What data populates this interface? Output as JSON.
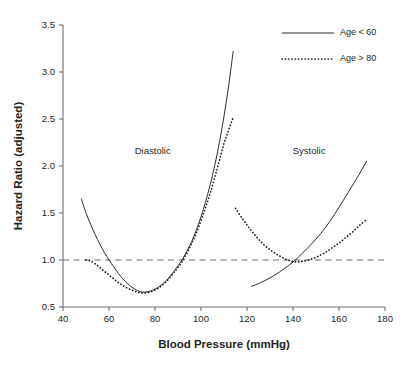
{
  "chart_data": {
    "type": "line",
    "title": "",
    "xlabel": "Blood Pressure (mmHg)",
    "ylabel": "Hazard Ratio (adjusted)",
    "xlim": [
      40,
      180
    ],
    "ylim": [
      0.5,
      3.5
    ],
    "xticks": [
      "40",
      "60",
      "80",
      "100",
      "120",
      "140",
      "160",
      "180"
    ],
    "xtick_values": [
      40,
      60,
      80,
      100,
      120,
      140,
      160,
      180
    ],
    "yticks": [
      "0.5",
      "1.0",
      "1.5",
      "2.0",
      "2.5",
      "3.0",
      "3.5"
    ],
    "ytick_values": [
      0.5,
      1.0,
      1.5,
      2.0,
      2.5,
      3.0,
      3.5
    ],
    "grid": false,
    "legend_position": "top-right",
    "reference_line": {
      "y": 1.0,
      "style": "dashed",
      "color": "#6d6e71"
    },
    "annotations": [
      {
        "text": "Diastolic",
        "x": 79,
        "y": 2.13
      },
      {
        "text": "Systolic",
        "x": 147,
        "y": 2.13
      }
    ],
    "legend": [
      {
        "name": "Age < 60",
        "style": "solid"
      },
      {
        "name": "Age > 80",
        "style": "dotted"
      }
    ],
    "series": [
      {
        "name": "Diastolic, Age < 60",
        "group": "Diastolic",
        "legend": "Age < 60",
        "style": "solid",
        "color": "#231f20",
        "points": [
          [
            48,
            1.65
          ],
          [
            50,
            1.5
          ],
          [
            52,
            1.38
          ],
          [
            54,
            1.27
          ],
          [
            56,
            1.17
          ],
          [
            58,
            1.08
          ],
          [
            60,
            1.0
          ],
          [
            62,
            0.93
          ],
          [
            64,
            0.86
          ],
          [
            66,
            0.8
          ],
          [
            68,
            0.75
          ],
          [
            70,
            0.71
          ],
          [
            72,
            0.68
          ],
          [
            74,
            0.66
          ],
          [
            76,
            0.66
          ],
          [
            78,
            0.67
          ],
          [
            80,
            0.69
          ],
          [
            82,
            0.72
          ],
          [
            84,
            0.76
          ],
          [
            86,
            0.81
          ],
          [
            88,
            0.87
          ],
          [
            90,
            0.94
          ],
          [
            92,
            1.01
          ],
          [
            94,
            1.1
          ],
          [
            96,
            1.2
          ],
          [
            98,
            1.32
          ],
          [
            100,
            1.46
          ],
          [
            102,
            1.62
          ],
          [
            104,
            1.8
          ],
          [
            106,
            2.01
          ],
          [
            108,
            2.25
          ],
          [
            110,
            2.53
          ],
          [
            112,
            2.85
          ],
          [
            114,
            3.22
          ]
        ]
      },
      {
        "name": "Diastolic, Age > 80",
        "group": "Diastolic",
        "legend": "Age > 80",
        "style": "dotted",
        "color": "#231f20",
        "points": [
          [
            50,
            1.0
          ],
          [
            52,
            0.99
          ],
          [
            54,
            0.96
          ],
          [
            56,
            0.92
          ],
          [
            58,
            0.88
          ],
          [
            60,
            0.84
          ],
          [
            62,
            0.8
          ],
          [
            64,
            0.76
          ],
          [
            66,
            0.73
          ],
          [
            68,
            0.7
          ],
          [
            70,
            0.68
          ],
          [
            72,
            0.66
          ],
          [
            74,
            0.65
          ],
          [
            76,
            0.65
          ],
          [
            78,
            0.66
          ],
          [
            80,
            0.68
          ],
          [
            82,
            0.71
          ],
          [
            84,
            0.75
          ],
          [
            86,
            0.8
          ],
          [
            88,
            0.86
          ],
          [
            90,
            0.92
          ],
          [
            92,
            0.99
          ],
          [
            94,
            1.08
          ],
          [
            96,
            1.18
          ],
          [
            98,
            1.29
          ],
          [
            100,
            1.42
          ],
          [
            102,
            1.56
          ],
          [
            104,
            1.71
          ],
          [
            106,
            1.88
          ],
          [
            108,
            2.06
          ],
          [
            110,
            2.24
          ],
          [
            112,
            2.38
          ],
          [
            114,
            2.52
          ]
        ]
      },
      {
        "name": "Systolic, Age < 60",
        "group": "Systolic",
        "legend": "Age < 60",
        "style": "solid",
        "color": "#231f20",
        "points": [
          [
            122,
            0.72
          ],
          [
            126,
            0.76
          ],
          [
            130,
            0.81
          ],
          [
            134,
            0.87
          ],
          [
            138,
            0.94
          ],
          [
            141,
            1.0
          ],
          [
            144,
            1.07
          ],
          [
            148,
            1.17
          ],
          [
            152,
            1.28
          ],
          [
            156,
            1.41
          ],
          [
            160,
            1.56
          ],
          [
            164,
            1.72
          ],
          [
            168,
            1.88
          ],
          [
            172,
            2.05
          ]
        ]
      },
      {
        "name": "Systolic, Age > 80",
        "group": "Systolic",
        "legend": "Age > 80",
        "style": "dotted",
        "color": "#231f20",
        "points": [
          [
            115,
            1.55
          ],
          [
            118,
            1.44
          ],
          [
            121,
            1.34
          ],
          [
            124,
            1.25
          ],
          [
            127,
            1.17
          ],
          [
            130,
            1.11
          ],
          [
            133,
            1.06
          ],
          [
            136,
            1.02
          ],
          [
            139,
            0.99
          ],
          [
            142,
            0.98
          ],
          [
            145,
            0.99
          ],
          [
            148,
            1.01
          ],
          [
            151,
            1.04
          ],
          [
            154,
            1.08
          ],
          [
            157,
            1.13
          ],
          [
            160,
            1.18
          ],
          [
            163,
            1.24
          ],
          [
            166,
            1.3
          ],
          [
            169,
            1.37
          ],
          [
            172,
            1.43
          ]
        ]
      }
    ]
  }
}
